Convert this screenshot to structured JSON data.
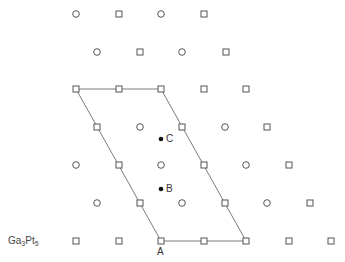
{
  "diagram": {
    "compound_label": {
      "prefix": "Ga",
      "sub1": "3",
      "mid": "Pt",
      "sub2": "5"
    },
    "stroke_color": "#555555",
    "line_color": "#7a7a7a",
    "point_labels": {
      "A": "A",
      "B": "B",
      "C": "C"
    },
    "parallelogram": [
      [
        76,
        89
      ],
      [
        161,
        89
      ],
      [
        246,
        241
      ],
      [
        161,
        241
      ]
    ],
    "atoms": [
      {
        "type": "circle",
        "x": 76,
        "y": 14
      },
      {
        "type": "square",
        "x": 119,
        "y": 14
      },
      {
        "type": "circle",
        "x": 161,
        "y": 14
      },
      {
        "type": "square",
        "x": 204,
        "y": 14
      },
      {
        "type": "circle",
        "x": 97,
        "y": 52
      },
      {
        "type": "square",
        "x": 140,
        "y": 52
      },
      {
        "type": "circle",
        "x": 182,
        "y": 52
      },
      {
        "type": "square",
        "x": 226,
        "y": 52
      },
      {
        "type": "square",
        "x": 76,
        "y": 89
      },
      {
        "type": "square",
        "x": 119,
        "y": 89
      },
      {
        "type": "square",
        "x": 161,
        "y": 89
      },
      {
        "type": "square",
        "x": 204,
        "y": 89
      },
      {
        "type": "square",
        "x": 246,
        "y": 89
      },
      {
        "type": "square",
        "x": 97,
        "y": 127
      },
      {
        "type": "circle",
        "x": 140,
        "y": 127
      },
      {
        "type": "square",
        "x": 182,
        "y": 127
      },
      {
        "type": "circle",
        "x": 225,
        "y": 127
      },
      {
        "type": "square",
        "x": 267,
        "y": 127
      },
      {
        "type": "circle",
        "x": 76,
        "y": 165
      },
      {
        "type": "square",
        "x": 119,
        "y": 165
      },
      {
        "type": "circle",
        "x": 161,
        "y": 165
      },
      {
        "type": "square",
        "x": 204,
        "y": 165
      },
      {
        "type": "circle",
        "x": 246,
        "y": 165
      },
      {
        "type": "square",
        "x": 289,
        "y": 165
      },
      {
        "type": "circle",
        "x": 97,
        "y": 203
      },
      {
        "type": "square",
        "x": 140,
        "y": 203
      },
      {
        "type": "circle",
        "x": 182,
        "y": 203
      },
      {
        "type": "square",
        "x": 225,
        "y": 203
      },
      {
        "type": "circle",
        "x": 267,
        "y": 203
      },
      {
        "type": "square",
        "x": 310,
        "y": 203
      },
      {
        "type": "square",
        "x": 76,
        "y": 241
      },
      {
        "type": "square",
        "x": 119,
        "y": 241
      },
      {
        "type": "square",
        "x": 161,
        "y": 241
      },
      {
        "type": "square",
        "x": 204,
        "y": 241
      },
      {
        "type": "square",
        "x": 246,
        "y": 241
      },
      {
        "type": "square",
        "x": 289,
        "y": 241
      },
      {
        "type": "square",
        "x": 331,
        "y": 241
      }
    ],
    "marked_points": [
      {
        "name": "C",
        "x": 161,
        "y": 139
      },
      {
        "name": "B",
        "x": 161,
        "y": 189
      }
    ]
  }
}
